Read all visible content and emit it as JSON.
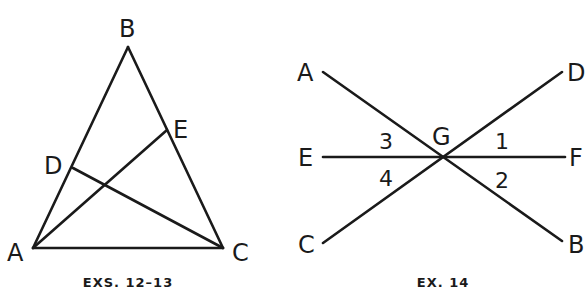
{
  "figures": [
    {
      "id": "triangle",
      "caption": "EXS. 12–13",
      "points": {
        "A": {
          "label": "A"
        },
        "B": {
          "label": "B"
        },
        "C": {
          "label": "C"
        },
        "D": {
          "label": "D"
        },
        "E": {
          "label": "E"
        }
      },
      "segments": [
        "AB",
        "BC",
        "CA",
        "AE",
        "CD"
      ]
    },
    {
      "id": "intersecting-lines",
      "caption": "EX. 14",
      "points": {
        "A": {
          "label": "A"
        },
        "B": {
          "label": "B"
        },
        "C": {
          "label": "C"
        },
        "D": {
          "label": "D"
        },
        "E": {
          "label": "E"
        },
        "F": {
          "label": "F"
        },
        "G": {
          "label": "G"
        }
      },
      "angles": {
        "1": {
          "label": "1"
        },
        "2": {
          "label": "2"
        },
        "3": {
          "label": "3"
        },
        "4": {
          "label": "4"
        }
      },
      "segments": [
        "AB",
        "CD",
        "EF"
      ],
      "intersection": "G"
    }
  ],
  "colors": {
    "stroke": "#1a1a1a",
    "background": "#ffffff"
  }
}
